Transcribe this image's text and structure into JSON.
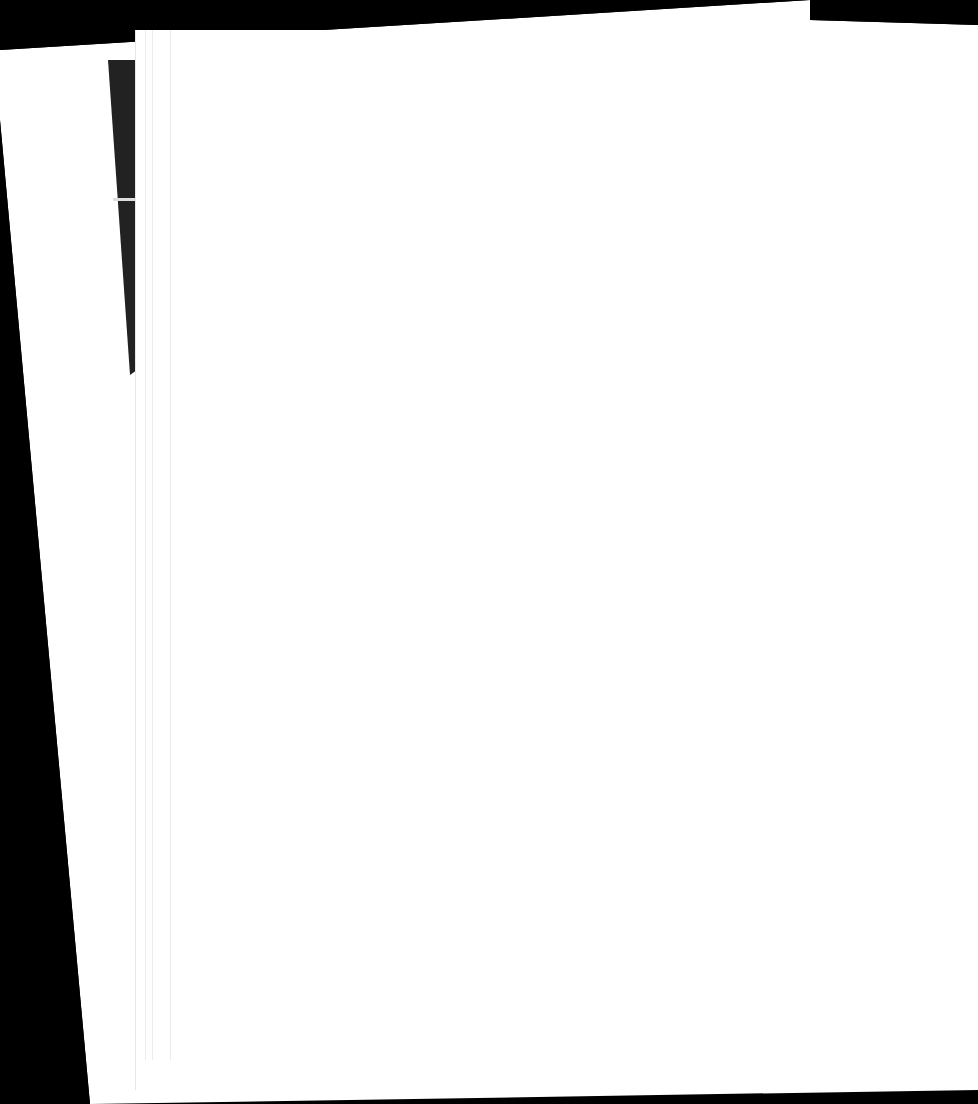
{
  "scene": {
    "description": "",
    "background_color": "#000000",
    "paper_color": "#ffffff",
    "strip_color": "#222222"
  }
}
